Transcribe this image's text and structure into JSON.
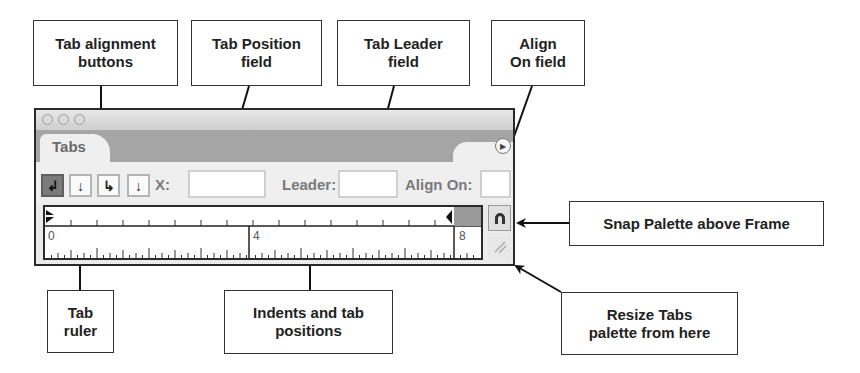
{
  "callouts": {
    "tab_alignment": "Tab alignment\nbuttons",
    "tab_position": "Tab Position\nfield",
    "tab_leader": "Tab Leader\nfield",
    "align_on": "Align\nOn field",
    "snap": "Snap Palette above Frame",
    "resize": "Resize Tabs\npalette from here",
    "tab_ruler": "Tab\nruler",
    "indents": "Indents and tab\npositions"
  },
  "panel": {
    "tab_label": "Tabs",
    "menu_icon": "flyout-menu-icon",
    "align_buttons": [
      {
        "name": "left-justified-tab",
        "glyph": "↲",
        "selected": true
      },
      {
        "name": "center-justified-tab",
        "glyph": "↓",
        "selected": false
      },
      {
        "name": "right-justified-tab",
        "glyph": "↳",
        "selected": false
      },
      {
        "name": "align-to-decimal-tab",
        "glyph": "↓",
        "selected": false
      }
    ],
    "x_label": "X:",
    "x_value": "",
    "leader_label": "Leader:",
    "leader_value": "",
    "align_on_label": "Align On:",
    "align_on_value": "",
    "ruler": {
      "labels": [
        "0",
        "4",
        "8"
      ],
      "units_per_major": 4
    },
    "snap_icon": "magnet-icon",
    "resize_icon": "resize-grip-icon"
  }
}
